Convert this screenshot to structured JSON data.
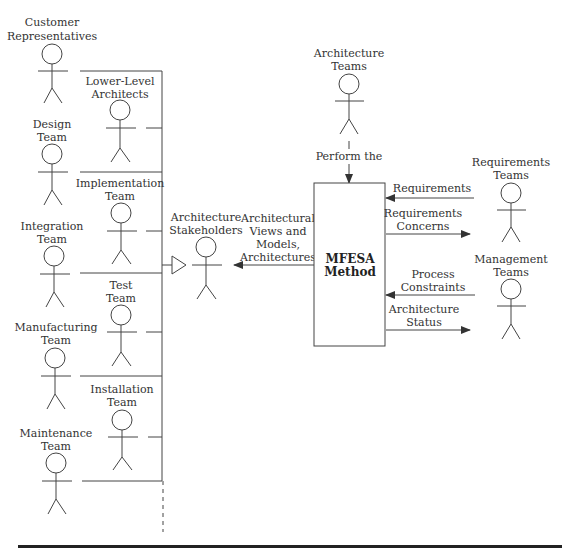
{
  "diagram": {
    "left_column_actors": [
      {
        "id": "customer",
        "label": [
          "Customer",
          "Representatives"
        ]
      },
      {
        "id": "design",
        "label": [
          "Design",
          "Team"
        ]
      },
      {
        "id": "integration",
        "label": [
          "Integration",
          "Team"
        ]
      },
      {
        "id": "manufacturing",
        "label": [
          "Manufacturing",
          "Team"
        ]
      },
      {
        "id": "maintenance",
        "label": [
          "Maintenance",
          "Team"
        ]
      }
    ],
    "inner_column_actors": [
      {
        "id": "lower-level",
        "label": [
          "Lower-Level",
          "Architects"
        ]
      },
      {
        "id": "implementation",
        "label": [
          "Implementation",
          "Team"
        ]
      },
      {
        "id": "test",
        "label": [
          "Test",
          "Team"
        ]
      },
      {
        "id": "installation",
        "label": [
          "Installation",
          "Team"
        ]
      }
    ],
    "stakeholders": {
      "label": [
        "Architecture",
        "Stakeholders"
      ]
    },
    "architecture_teams": {
      "label": [
        "Architecture",
        "Teams"
      ],
      "relation": "Perform the"
    },
    "method_box": {
      "label": [
        "MFESA",
        "Method"
      ]
    },
    "requirements_teams": {
      "label": [
        "Requirements",
        "Teams"
      ]
    },
    "management_teams": {
      "label": [
        "Management",
        "Teams"
      ]
    },
    "flows": {
      "to_stakeholders": [
        "Architectural",
        "Views and",
        "Models,",
        "Architectures"
      ],
      "requirements": "Requirements",
      "requirements_concerns": [
        "Requirements",
        "Concerns"
      ],
      "process_constraints": [
        "Process",
        "Constraints"
      ],
      "architecture_status": [
        "Architecture",
        "Status"
      ]
    }
  }
}
